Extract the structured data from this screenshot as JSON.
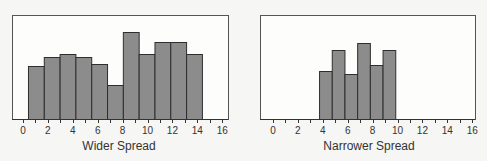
{
  "chart_data": [
    {
      "type": "bar",
      "title": "",
      "xlabel": "Wider Spread",
      "ylabel": "",
      "xlim": [
        0,
        16
      ],
      "x_ticks": [
        0,
        2,
        4,
        6,
        8,
        10,
        12,
        14,
        16
      ],
      "bin_start": 0.4,
      "bin_width": 1.27,
      "values": [
        53,
        62,
        65,
        62,
        55,
        34,
        87,
        65,
        77,
        77,
        65
      ],
      "grid": false,
      "legend": null
    },
    {
      "type": "bar",
      "title": "",
      "xlabel": "Narrower Spread",
      "ylabel": "",
      "xlim": [
        0,
        16
      ],
      "x_ticks": [
        0,
        2,
        4,
        6,
        8,
        10,
        12,
        14,
        16
      ],
      "bin_start": 3.7,
      "bin_width": 1.02,
      "values": [
        48,
        69,
        45,
        76,
        54,
        69
      ],
      "grid": false,
      "legend": null
    }
  ],
  "panels": [
    {
      "frame": {
        "x": 12,
        "y": 15,
        "w": 216,
        "h": 104
      },
      "x0px": 23,
      "pxPerUnit": 12.45,
      "baseline": 119,
      "xlabel_pos": {
        "x": 119,
        "y": 150
      }
    },
    {
      "frame": {
        "x": 260,
        "y": 15,
        "w": 215,
        "h": 104
      },
      "x0px": 273,
      "pxPerUnit": 12.45,
      "baseline": 119,
      "xlabel_pos": {
        "x": 369,
        "y": 150
      }
    }
  ],
  "colors": {
    "bar_fill": "#8c8c8c",
    "bar_stroke": "#2e2e2e",
    "background": "#f6f6f4"
  }
}
